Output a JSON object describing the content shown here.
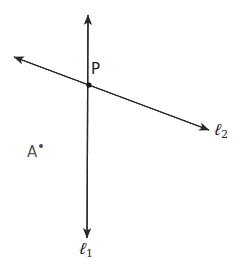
{
  "figure": {
    "canvas": {
      "width": 249,
      "height": 264,
      "background": "#ffffff"
    },
    "stroke_color": "#262a2e",
    "stroke_width": 1.3
  },
  "labels": {
    "point_p": "P",
    "point_a": "A",
    "line1_name": "ℓ",
    "line1_subscript": "1",
    "line2_name": "ℓ",
    "line2_subscript": "2"
  },
  "geometry": {
    "lines": [
      {
        "name": "line-1",
        "label": "ℓ1",
        "orientation": "vertical",
        "x1": 88,
        "y1": 15,
        "x2": 87,
        "y2": 238,
        "arrow_start": true,
        "arrow_end": true
      },
      {
        "name": "line-2",
        "label": "ℓ2",
        "orientation": "oblique",
        "x1": 14,
        "y1": 57,
        "x2": 209,
        "y2": 130,
        "arrow_start": true,
        "arrow_end": true
      }
    ],
    "points": [
      {
        "name": "P",
        "x": 89,
        "y": 85,
        "filled": true,
        "radius": 2.6,
        "on_lines": [
          "line-1",
          "line-2"
        ]
      },
      {
        "name": "A",
        "x": 41,
        "y": 146,
        "filled": true,
        "radius": 2.0,
        "on_lines": []
      }
    ]
  }
}
